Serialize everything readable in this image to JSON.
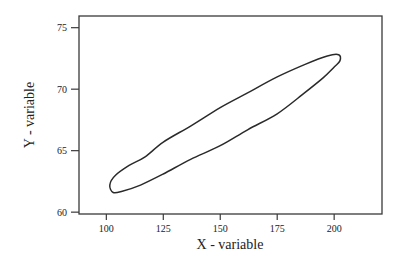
{
  "chart_data": {
    "type": "line",
    "title": "",
    "xlabel": "X - variable",
    "ylabel": "Y - variable",
    "xlim": [
      88,
      221
    ],
    "ylim": [
      59.85,
      75.95
    ],
    "xticks": [
      100,
      125,
      150,
      175,
      200
    ],
    "yticks": [
      60,
      65,
      70,
      75
    ],
    "xtick_labels": [
      "100",
      "125",
      "150",
      "175",
      "200"
    ],
    "ytick_labels": [
      "60",
      "65",
      "70",
      "75"
    ],
    "grid": false,
    "legend": null,
    "series": [
      {
        "name": "contour",
        "closed": true,
        "points": [
          [
            103,
            61.6
          ],
          [
            101.5,
            62.2
          ],
          [
            104,
            63.0
          ],
          [
            110,
            63.8
          ],
          [
            117,
            64.5
          ],
          [
            125,
            65.7
          ],
          [
            137,
            67.0
          ],
          [
            150,
            68.5
          ],
          [
            162,
            69.7
          ],
          [
            175,
            71.0
          ],
          [
            187,
            72.0
          ],
          [
            197,
            72.7
          ],
          [
            202,
            72.8
          ],
          [
            202.5,
            72.3
          ],
          [
            200,
            71.8
          ],
          [
            195,
            70.9
          ],
          [
            187,
            69.7
          ],
          [
            175,
            68.0
          ],
          [
            162,
            66.7
          ],
          [
            150,
            65.4
          ],
          [
            137,
            64.3
          ],
          [
            125,
            63.1
          ],
          [
            115,
            62.2
          ],
          [
            107,
            61.7
          ]
        ]
      }
    ],
    "colors": {
      "line": "#2a2a2a",
      "frame": "#3a3a3a"
    }
  }
}
